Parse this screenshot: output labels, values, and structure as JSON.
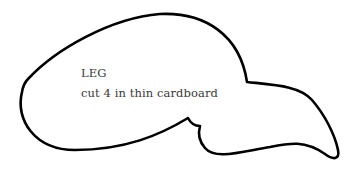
{
  "template": {
    "piece_name": "LEG",
    "instruction": "cut 4 in thin cardboard",
    "outline_color": "#000000",
    "text_color": "#3a3a3a",
    "background_color": "#ffffff"
  }
}
